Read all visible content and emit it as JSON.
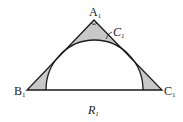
{
  "diagram": {
    "type": "geometry",
    "colors": {
      "shade": "#c8c8c8",
      "stroke": "#1a1a1a"
    },
    "vertices": {
      "A": {
        "label": "A",
        "sub": "1"
      },
      "B": {
        "label": "B",
        "sub": "1"
      },
      "C": {
        "label": "C",
        "sub": "1"
      }
    },
    "arc_label": {
      "label": "C",
      "sub": "1"
    },
    "region_label": {
      "label": "R",
      "sub": "1"
    }
  }
}
